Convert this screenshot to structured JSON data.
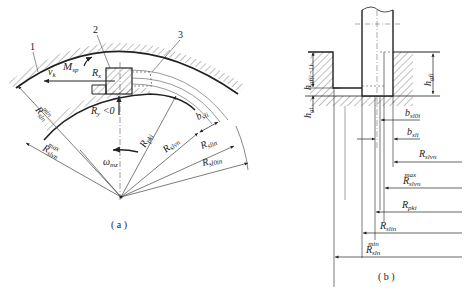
{
  "figure": {
    "panel_a": {
      "caption": "( a )",
      "part_labels": [
        "1",
        "2",
        "3"
      ],
      "labels": {
        "Msp": {
          "main": "M",
          "sub": "sp"
        },
        "vk": {
          "main": "v",
          "sub": "k"
        },
        "Rx": {
          "main": "R",
          "sub": "x"
        },
        "Ry": {
          "main": "R",
          "sub": "y",
          "suffix": " <0"
        },
        "Rsln_min": {
          "main": "R",
          "sub": "sln",
          "sup": "min"
        },
        "Rslvn_max": {
          "main": "R",
          "sub": "slvn",
          "sup": "max"
        },
        "omega_mz": {
          "main": "ω",
          "sub": "mz"
        },
        "Rpki": {
          "main": "R",
          "sub": "pki"
        },
        "Rslvn": {
          "main": "R",
          "sub": "slvn"
        },
        "bsli": {
          "main": "b",
          "sub": "sli"
        },
        "Rslin": {
          "main": "R",
          "sub": "slin"
        },
        "Rsl0in": {
          "main": "R",
          "sub": "sl0in"
        }
      }
    },
    "panel_b": {
      "caption": "( b )",
      "labels": {
        "hgfi_1": {
          "main": "h",
          "sub": "gf(i−1)"
        },
        "hgi": {
          "main": "h",
          "sub": "gi"
        },
        "hgfi": {
          "main": "h",
          "sub": "gfi"
        },
        "bsl0i": {
          "main": "b",
          "sub": "sl0i"
        },
        "bsli": {
          "main": "b",
          "sub": "sli"
        },
        "Rslvn": {
          "main": "R",
          "sub": "slvn"
        },
        "Rslvn_max": {
          "main": "R",
          "sub": "slvn",
          "sup": "max"
        },
        "Rpki": {
          "main": "R",
          "sub": "pki"
        },
        "Rslin": {
          "main": "R",
          "sub": "slin"
        },
        "Rsln_min": {
          "main": "R",
          "sub": "sln",
          "sup": "min"
        }
      }
    }
  },
  "colors": {
    "line": "#222222",
    "thin": "#555555",
    "background": "#ffffff"
  }
}
